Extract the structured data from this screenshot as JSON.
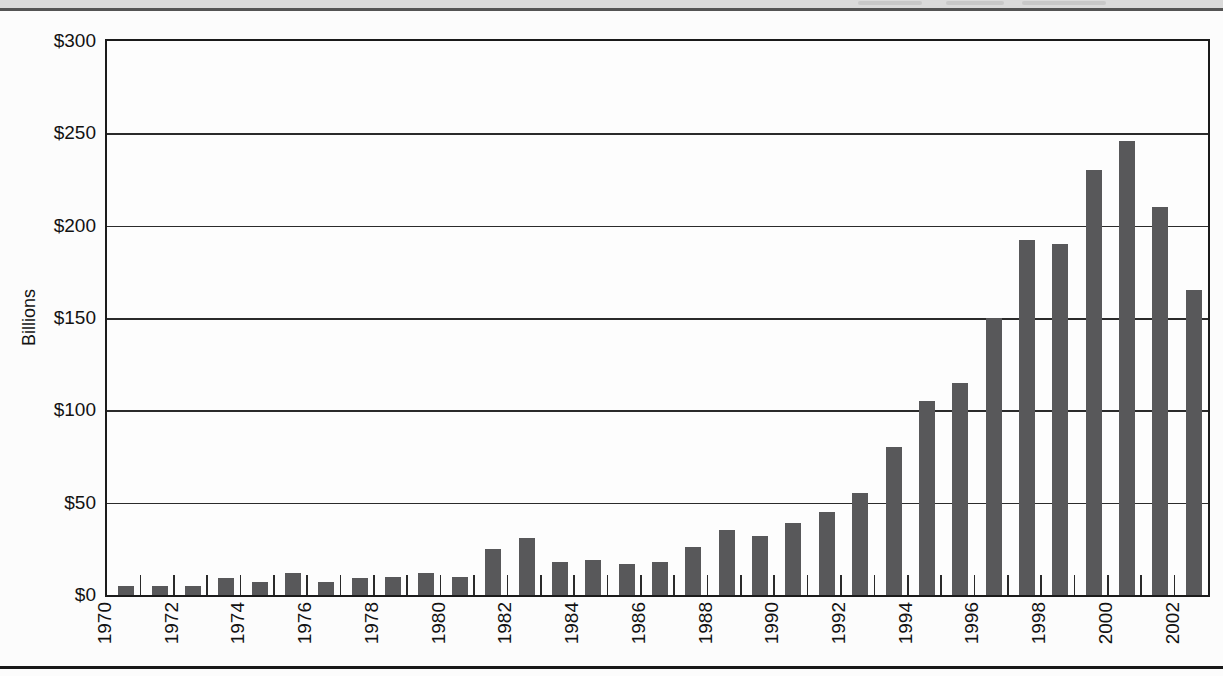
{
  "page": {
    "background_color": "#fcfcfc",
    "header_band_color": "#dadada",
    "header_rule_color": "#545454",
    "footer_rule_color": "#181818"
  },
  "chart_data": {
    "type": "bar",
    "title": "",
    "ylabel": "Billions",
    "ylim": [
      0,
      300
    ],
    "ytick_values": [
      0,
      50,
      100,
      150,
      200,
      250,
      300
    ],
    "ytick_labels": [
      "$0",
      "$50",
      "$100",
      "$150",
      "$200",
      "$250",
      "$300"
    ],
    "grid": "horizontal",
    "legend": "none",
    "bar_color": "#58585a",
    "categories": [
      "1970",
      "1971",
      "1972",
      "1973",
      "1974",
      "1975",
      "1976",
      "1977",
      "1978",
      "1979",
      "1980",
      "1981",
      "1982",
      "1983",
      "1984",
      "1985",
      "1986",
      "1987",
      "1988",
      "1989",
      "1990",
      "1991",
      "1992",
      "1993",
      "1994",
      "1995",
      "1996",
      "1997",
      "1998",
      "1999",
      "2000",
      "2001",
      "2002"
    ],
    "xtick_labels": [
      "1970",
      "1972",
      "1974",
      "1976",
      "1978",
      "1980",
      "1982",
      "1984",
      "1986",
      "1988",
      "1990",
      "1992",
      "1994",
      "1996",
      "1998",
      "2000",
      "2002"
    ],
    "xtick_label_every": 2,
    "values": [
      5,
      5,
      5,
      9,
      7,
      12,
      7,
      9,
      10,
      12,
      10,
      25,
      31,
      18,
      19,
      17,
      18,
      26,
      35,
      32,
      39,
      45,
      55,
      80,
      105,
      115,
      150,
      192,
      190,
      230,
      246,
      210,
      165
    ]
  }
}
